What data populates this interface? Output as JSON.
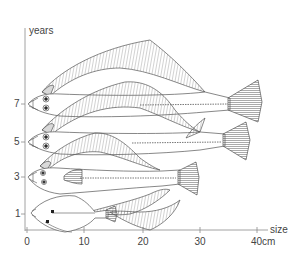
{
  "figure": {
    "y_axis": {
      "label": "years",
      "ticks": [
        {
          "value": "7",
          "y": 104
        },
        {
          "value": "5",
          "y": 142
        },
        {
          "value": "3",
          "y": 177
        },
        {
          "value": "1",
          "y": 214
        }
      ]
    },
    "x_axis": {
      "label": "size",
      "unit": "cm",
      "ticks": [
        {
          "value": "0",
          "x": 27
        },
        {
          "value": "10",
          "x": 84
        },
        {
          "value": "20",
          "x": 143
        },
        {
          "value": "30",
          "x": 200
        },
        {
          "value": "40cm",
          "x": 257
        }
      ]
    },
    "fish": [
      {
        "age": "7",
        "approx_length_cm": 40
      },
      {
        "age": "5",
        "approx_length_cm": 38
      },
      {
        "age": "3",
        "approx_length_cm": 30
      },
      {
        "age": "1",
        "approx_length_cm": 13
      }
    ],
    "colors": {
      "line": "#555555",
      "axis": "#8a8a8a",
      "text": "#444444",
      "fin_fill": "#d9d9d9"
    }
  }
}
